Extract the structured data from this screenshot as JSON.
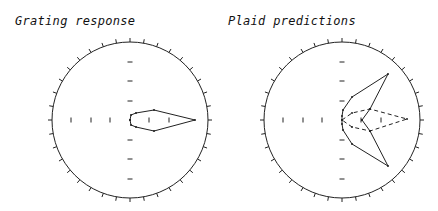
{
  "panels": [
    {
      "title": "Grating response"
    },
    {
      "title": "Plaid predictions"
    }
  ],
  "chart_data": [
    {
      "type": "polar",
      "title": "Grating response",
      "center": [
        130,
        120
      ],
      "radius": 78,
      "rim_ticks": 36,
      "grid_ticks": {
        "horizontal_x": [
          71,
          91,
          110,
          149,
          169
        ],
        "vertical_y": [
          62,
          81,
          101,
          140,
          159,
          179
        ]
      },
      "series": [
        {
          "name": "grating",
          "style": "solid",
          "points": [
            [
              130,
              120
            ],
            [
              131,
              115
            ],
            [
              136,
              113
            ],
            [
              154,
              110
            ],
            [
              195,
              120
            ],
            [
              154,
              131
            ],
            [
              136,
              127
            ],
            [
              131,
              125
            ],
            [
              130,
              120
            ]
          ]
        }
      ]
    },
    {
      "type": "polar",
      "title": "Plaid predictions",
      "center": [
        342,
        120
      ],
      "radius": 78,
      "rim_ticks": 36,
      "grid_ticks": {
        "horizontal_x": [
          283,
          303,
          322,
          361,
          381
        ],
        "vertical_y": [
          62,
          81,
          101,
          140,
          159,
          179
        ]
      },
      "series": [
        {
          "name": "prediction-1",
          "style": "solid",
          "points": [
            [
              362,
              120
            ],
            [
              370,
              109
            ],
            [
              388,
              74
            ],
            [
              352,
              97
            ],
            [
              343,
              110
            ],
            [
              342,
              116
            ],
            [
              342,
              124
            ],
            [
              343,
              130
            ],
            [
              352,
              144
            ],
            [
              388,
              166
            ],
            [
              370,
              131
            ],
            [
              362,
              120
            ]
          ]
        },
        {
          "name": "prediction-2",
          "style": "dashed",
          "points": [
            [
              342,
              120
            ],
            [
              352,
              113
            ],
            [
              370,
              109
            ],
            [
              407,
              119
            ],
            [
              370,
              131
            ],
            [
              352,
              127
            ],
            [
              342,
              120
            ]
          ]
        }
      ]
    }
  ]
}
